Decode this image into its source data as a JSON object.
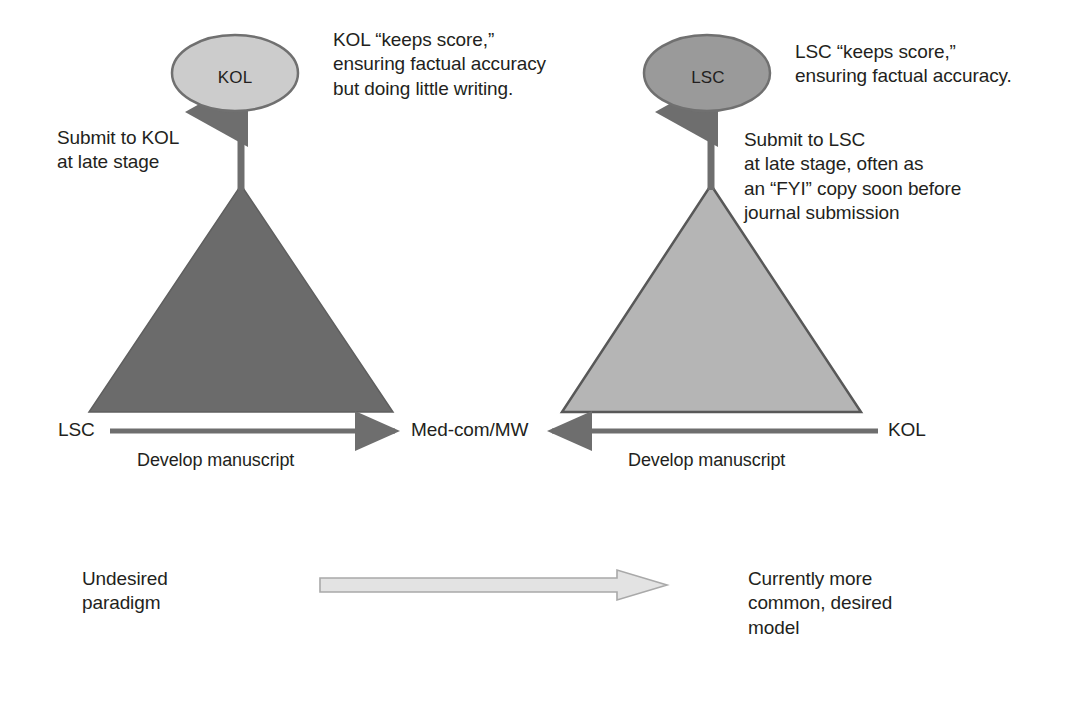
{
  "figure": {
    "kind": "comparison-diagram",
    "background_color": "#ffffff",
    "text_color": "#231f20"
  },
  "panels": [
    {
      "id": "left",
      "top_node": {
        "label": "KOL",
        "shape": "ellipse",
        "fill": "#cccccc",
        "stroke": "#6e6e6e"
      },
      "triangle": {
        "fill": "#6b6b6b",
        "stroke": "#5a5a5a"
      },
      "connector_note": "Submit to KOL\nat late stage",
      "callout": "KOL “keeps score,”\nensuring factual accuracy\nbut doing little writing.",
      "axis": {
        "start_label": "LSC",
        "end_label": "Med-com/MW",
        "caption": "Develop manuscript",
        "direction": "right",
        "color": "#6e6e6e"
      },
      "legend": "Undesired\nparadigm"
    },
    {
      "id": "right",
      "top_node": {
        "label": "LSC",
        "shape": "ellipse",
        "fill": "#9a9a9a",
        "stroke": "#6e6e6e"
      },
      "triangle": {
        "fill": "#b5b5b5",
        "stroke": "#585858"
      },
      "connector_note": "Submit to LSC\nat late stage, often as\nan “FYI” copy soon before\njournal submission",
      "callout": "LSC “keeps score,”\nensuring factual accuracy.",
      "axis": {
        "start_label": "Med-com/MW",
        "end_label": "KOL",
        "caption": "Develop manuscript",
        "direction": "left",
        "color": "#6e6e6e"
      },
      "legend": "Currently more\ncommon, desired\nmodel"
    }
  ],
  "transition_arrow": {
    "name": "paradigm-shift-arrow",
    "direction": "right",
    "fill": "#e0e0e0",
    "stroke": "#a8a8a8"
  },
  "shared_labels": {
    "med_com_mw": "Med-com/MW"
  }
}
